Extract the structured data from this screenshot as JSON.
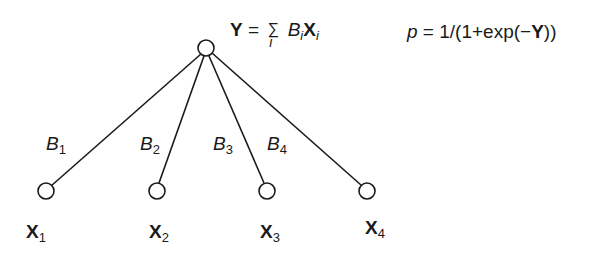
{
  "diagram": {
    "type": "logistic-regression-network",
    "top_node": {
      "id": "Y",
      "cx": 206,
      "cy": 48,
      "r": 8
    },
    "input_nodes": [
      {
        "id": "X1",
        "var": "X",
        "sub": "1",
        "cx": 46,
        "cy": 191,
        "r": 8
      },
      {
        "id": "X2",
        "var": "X",
        "sub": "2",
        "cx": 157,
        "cy": 191,
        "r": 8
      },
      {
        "id": "X3",
        "var": "X",
        "sub": "3",
        "cx": 267,
        "cy": 191,
        "r": 8
      },
      {
        "id": "X4",
        "var": "X",
        "sub": "4",
        "cx": 367,
        "cy": 191,
        "r": 8
      }
    ],
    "edge_labels": [
      {
        "var": "B",
        "sub": "1"
      },
      {
        "var": "B",
        "sub": "2"
      },
      {
        "var": "B",
        "sub": "3"
      },
      {
        "var": "B",
        "sub": "4"
      }
    ],
    "sum_equation": {
      "lhs": "Y",
      "eq": "=",
      "sigma": "∑",
      "index": "i",
      "term_b": "B",
      "term_x": "X",
      "sub": "i"
    },
    "prob_equation": {
      "var": "p",
      "eq": "=",
      "pre": "1/(1+exp(−",
      "y": "Y",
      "post": "))"
    },
    "colors": {
      "line": "#1a1a1a",
      "background": "#ffffff"
    }
  }
}
